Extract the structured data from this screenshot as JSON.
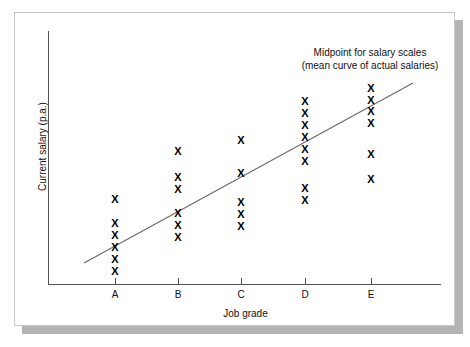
{
  "figure": {
    "background_color": "#ffffff",
    "card_border_color": "#c8c8c8",
    "shadow_color": "#b4b4b4"
  },
  "annotation": {
    "line1": "Midpoint for salary scales",
    "line2": "(mean curve of actual salaries)"
  },
  "axes": {
    "x_title": "Job grade",
    "y_title": "Current salary (p.a.)",
    "axis_color": "#555555"
  },
  "chart_data": {
    "type": "scatter",
    "title": "",
    "xlabel": "Job grade",
    "ylabel": "Current salary (p.a.)",
    "grid": false,
    "legend": null,
    "marker": "X",
    "marker_color": "#000000",
    "categories": [
      "A",
      "B",
      "C",
      "D",
      "E"
    ],
    "xlim": [
      0,
      6
    ],
    "ylim": [
      0,
      10
    ],
    "annotations": [
      {
        "text": "Midpoint for salary scales (mean curve of actual salaries)",
        "x": 4.6,
        "y": 9.3
      }
    ],
    "series": [
      {
        "name": "Actual salaries",
        "points": [
          {
            "category": "A",
            "x": 1,
            "y": 3.35
          },
          {
            "category": "A",
            "x": 1,
            "y": 2.4
          },
          {
            "category": "A",
            "x": 1,
            "y": 1.95
          },
          {
            "category": "A",
            "x": 1,
            "y": 1.5
          },
          {
            "category": "A",
            "x": 1,
            "y": 1.05
          },
          {
            "category": "A",
            "x": 1,
            "y": 0.6
          },
          {
            "category": "B",
            "x": 2,
            "y": 5.15
          },
          {
            "category": "B",
            "x": 2,
            "y": 4.15
          },
          {
            "category": "B",
            "x": 2,
            "y": 3.7
          },
          {
            "category": "B",
            "x": 2,
            "y": 2.8
          },
          {
            "category": "B",
            "x": 2,
            "y": 2.35
          },
          {
            "category": "B",
            "x": 2,
            "y": 1.9
          },
          {
            "category": "C",
            "x": 3,
            "y": 5.55
          },
          {
            "category": "C",
            "x": 3,
            "y": 4.3
          },
          {
            "category": "C",
            "x": 3,
            "y": 3.2
          },
          {
            "category": "C",
            "x": 3,
            "y": 2.75
          },
          {
            "category": "C",
            "x": 3,
            "y": 2.3
          },
          {
            "category": "D",
            "x": 4,
            "y": 7.05
          },
          {
            "category": "D",
            "x": 4,
            "y": 6.6
          },
          {
            "category": "D",
            "x": 4,
            "y": 6.15
          },
          {
            "category": "D",
            "x": 4,
            "y": 5.7
          },
          {
            "category": "D",
            "x": 4,
            "y": 5.25
          },
          {
            "category": "D",
            "x": 4,
            "y": 4.8
          },
          {
            "category": "D",
            "x": 4,
            "y": 3.8
          },
          {
            "category": "D",
            "x": 4,
            "y": 3.35
          },
          {
            "category": "E",
            "x": 5,
            "y": 7.55
          },
          {
            "category": "E",
            "x": 5,
            "y": 7.1
          },
          {
            "category": "E",
            "x": 5,
            "y": 6.7
          },
          {
            "category": "E",
            "x": 5,
            "y": 6.25
          },
          {
            "category": "E",
            "x": 5,
            "y": 5.1
          },
          {
            "category": "E",
            "x": 5,
            "y": 4.2
          }
        ]
      }
    ],
    "trend_line": {
      "name": "Midpoint for salary scales (mean curve of actual salaries)",
      "color": "#6b6b6b",
      "start": {
        "x": 0.45,
        "y": 1.25
      },
      "end": {
        "x": 5.65,
        "y": 8.1
      }
    }
  },
  "_pixel_layout": {
    "comment": "pixel coordinates within the 441x314 card used for faithful placement",
    "tick_x": {
      "A": 100,
      "B": 163,
      "C": 226,
      "D": 290,
      "E": 356
    },
    "points_px": [
      {
        "cx": 100,
        "cy": 186
      },
      {
        "cx": 100,
        "cy": 210
      },
      {
        "cx": 100,
        "cy": 222
      },
      {
        "cx": 100,
        "cy": 234
      },
      {
        "cx": 100,
        "cy": 246
      },
      {
        "cx": 100,
        "cy": 258
      },
      {
        "cx": 163,
        "cy": 138
      },
      {
        "cx": 163,
        "cy": 164
      },
      {
        "cx": 163,
        "cy": 176
      },
      {
        "cx": 163,
        "cy": 200
      },
      {
        "cx": 163,
        "cy": 212
      },
      {
        "cx": 163,
        "cy": 224
      },
      {
        "cx": 226,
        "cy": 127
      },
      {
        "cx": 226,
        "cy": 160
      },
      {
        "cx": 226,
        "cy": 189
      },
      {
        "cx": 226,
        "cy": 201
      },
      {
        "cx": 226,
        "cy": 213
      },
      {
        "cx": 290,
        "cy": 88
      },
      {
        "cx": 290,
        "cy": 100
      },
      {
        "cx": 290,
        "cy": 112
      },
      {
        "cx": 290,
        "cy": 124
      },
      {
        "cx": 290,
        "cy": 136
      },
      {
        "cx": 290,
        "cy": 148
      },
      {
        "cx": 290,
        "cy": 175
      },
      {
        "cx": 290,
        "cy": 187
      },
      {
        "cx": 356,
        "cy": 75
      },
      {
        "cx": 356,
        "cy": 87
      },
      {
        "cx": 356,
        "cy": 98
      },
      {
        "cx": 356,
        "cy": 110
      },
      {
        "cx": 356,
        "cy": 141
      },
      {
        "cx": 356,
        "cy": 166
      }
    ],
    "trend_px": {
      "x1": 69,
      "y1": 250,
      "x2": 398,
      "y2": 70
    }
  }
}
